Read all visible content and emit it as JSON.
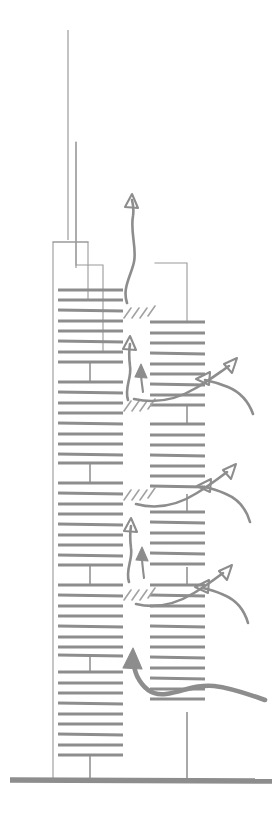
{
  "figure": {
    "kind": "architectural-section-diagram",
    "orientation": "vertical-section",
    "background_color": "#ffffff",
    "line_color": "#9a9a9a",
    "slab_color": "#8d8d8d",
    "arrow_color": "#8d8d8d",
    "hatch_color": "#a2a2a2",
    "canvas": {
      "width": 276,
      "height": 820
    }
  },
  "ground": {
    "label": "ground-line",
    "y": 780,
    "x_start": 10,
    "x_end": 272,
    "thickness": 5.5
  },
  "antenna": {
    "label": "roof-spire",
    "x": 68,
    "y_top": 30,
    "y_bottom": 240,
    "secondary_x": 76,
    "secondary_y_top": 142
  },
  "structure": {
    "towers": [
      {
        "name": "main-tower-left",
        "x_left": 53,
        "x_right": 88,
        "y_top": 242,
        "y_bottom": 780,
        "slab_x_start": 58,
        "slab_x_end": 123,
        "core_x": 90,
        "notch": {
          "x_left": 76,
          "x_right": 103,
          "y_top": 142,
          "y_bottom": 268,
          "step_y": 265
        }
      },
      {
        "name": "secondary-tower-right",
        "x_left": 155,
        "x_right": 187,
        "y_top": 263,
        "y_bottom": 780,
        "slab_x_start": 150,
        "slab_x_end": 205,
        "core_x": 187
      }
    ],
    "floor_slab_spacing_px": 10.2,
    "floor_slab_thickness_px": 2.9,
    "left_tower_slab_groups": [
      {
        "y_start": 290,
        "count": 7
      },
      {
        "y_start": 382,
        "count": 8
      },
      {
        "y_start": 483,
        "count": 8
      },
      {
        "y_start": 585,
        "count": 7
      },
      {
        "y_start": 672,
        "count": 8
      }
    ],
    "left_core_segments": [
      {
        "y_top": 362,
        "y_bottom": 382
      },
      {
        "y_top": 463,
        "y_bottom": 483
      },
      {
        "y_top": 565,
        "y_bottom": 585
      },
      {
        "y_top": 655,
        "y_bottom": 672
      },
      {
        "y_top": 754,
        "y_bottom": 780
      }
    ],
    "right_tower_slab_groups": [
      {
        "y_start": 322,
        "count": 8
      },
      {
        "y_start": 424,
        "count": 7
      },
      {
        "y_start": 512,
        "count": 6
      },
      {
        "y_start": 585,
        "count": 8
      },
      {
        "y_start": 672,
        "count": 4
      }
    ],
    "right_core_segments": [
      {
        "y_top": 404,
        "y_bottom": 424
      },
      {
        "y_top": 494,
        "y_bottom": 512
      },
      {
        "y_top": 567,
        "y_bottom": 585
      },
      {
        "y_top": 655,
        "y_bottom": 672
      },
      {
        "y_top": 712,
        "y_bottom": 780
      }
    ]
  },
  "sky_gardens": {
    "label": "hatched-void-marks",
    "description": "Short diagonal hatch strokes marking open sky-garden / transfer voids between slab stacks",
    "groups": [
      {
        "y": 315,
        "x": 124,
        "strokes": 4
      },
      {
        "y": 408,
        "x": 124,
        "strokes": 4
      },
      {
        "y": 497,
        "x": 124,
        "strokes": 4
      },
      {
        "y": 597,
        "x": 124,
        "strokes": 4
      }
    ]
  },
  "airflow": {
    "legend_note": "Gray freehand arrows indicate air movement",
    "arrows": [
      {
        "name": "exhaust-plume-top",
        "type": "outflow-up",
        "direction": "up",
        "x": 132,
        "y_tail": 300,
        "y_head": 196
      },
      {
        "name": "stack-riser-upper",
        "type": "internal-up",
        "direction": "up",
        "x": 130,
        "y_tail": 398,
        "y_head": 338
      },
      {
        "name": "stack-riser-upper-small",
        "type": "internal-up",
        "direction": "up",
        "x": 141,
        "y_tail": 392,
        "y_head": 366
      },
      {
        "name": "stack-riser-middle",
        "type": "internal-up",
        "direction": "up",
        "x": 131,
        "y_tail": 580,
        "y_head": 520
      },
      {
        "name": "stack-riser-middle-small",
        "type": "internal-up",
        "direction": "up",
        "x": 142,
        "y_tail": 578,
        "y_head": 548
      },
      {
        "name": "cross-flow-exhaust-upper",
        "type": "outflow-up-right",
        "direction": "up-right",
        "x_tail": 190,
        "y_tail": 396,
        "x_head": 238,
        "y_head": 360
      },
      {
        "name": "cross-flow-intake-upper",
        "type": "inflow-left",
        "direction": "left",
        "x_tail": 255,
        "y_tail": 410,
        "x_head": 196,
        "y_head": 380
      },
      {
        "name": "cross-flow-exhaust-middle",
        "type": "outflow-up-right",
        "direction": "up-right",
        "x_tail": 190,
        "y_tail": 500,
        "x_head": 238,
        "y_head": 466
      },
      {
        "name": "cross-flow-intake-middle",
        "type": "inflow-left",
        "direction": "left",
        "x_tail": 252,
        "y_tail": 518,
        "x_head": 198,
        "y_head": 486
      },
      {
        "name": "cross-flow-exhaust-lower",
        "type": "outflow-up-right",
        "direction": "up-right",
        "x_tail": 188,
        "y_tail": 600,
        "x_head": 234,
        "y_head": 566
      },
      {
        "name": "cross-flow-intake-lower",
        "type": "inflow-left",
        "direction": "left",
        "x_tail": 250,
        "y_tail": 620,
        "x_head": 196,
        "y_head": 590
      },
      {
        "name": "ground-level-intake",
        "type": "inflow-up-left",
        "direction": "up-left",
        "x_tail": 262,
        "y_tail": 700,
        "x_head": 136,
        "y_head": 650
      }
    ]
  }
}
